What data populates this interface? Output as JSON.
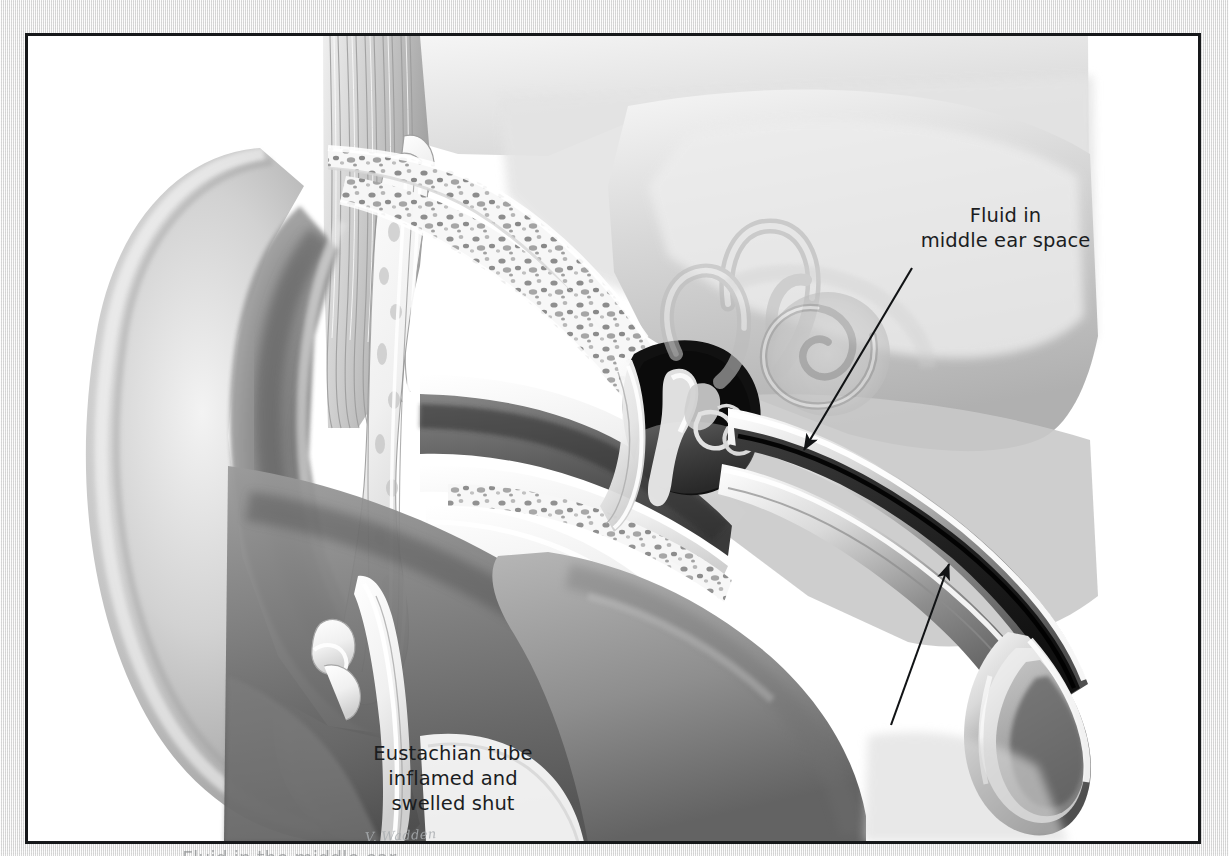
{
  "figure": {
    "medium": "grayscale airbrush / pencil medical illustration",
    "frame_color": "#16181a",
    "page_background_color": "#e9eaea",
    "figure_background_color": "#ffffff",
    "ink_color": "#1b1d1f"
  },
  "annotations": [
    {
      "id": "fluid",
      "text": "Fluid in\nmiddle ear space",
      "lines": [
        "Fluid in",
        "middle ear space"
      ],
      "arrow": {
        "from_x": 905,
        "from_y": 262,
        "to_x": 800,
        "to_y": 445
      }
    },
    {
      "id": "eustachian",
      "text": "Eustachian tube\ninflamed and\nswelled shut",
      "lines": [
        "Eustachian tube",
        "inflamed and",
        "swelled shut"
      ],
      "arrow": {
        "from_x": 888,
        "from_y": 718,
        "to_x": 946,
        "to_y": 556
      }
    }
  ],
  "artist_signature": "V. Wadden",
  "bottom_caption": "Fluid in the middle ear",
  "anatomy_structures": [
    "auricle (pinna)",
    "external auditory canal",
    "tympanic membrane (eardrum)",
    "ossicles — malleus, incus, stapes",
    "middle ear space filled with fluid",
    "mastoid air cells / cancellous bone",
    "semicircular canals",
    "cochlea",
    "eustachian tube, inflamed and swollen shut",
    "styloid process",
    "temporalis muscle"
  ]
}
